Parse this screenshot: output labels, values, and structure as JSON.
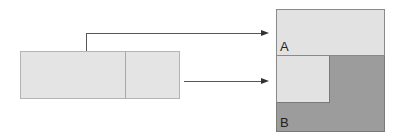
{
  "diagram": {
    "source": {
      "segments": 2
    },
    "target": {
      "regions": [
        {
          "label": "A",
          "color": "#e2e2e2"
        },
        {
          "label": "B",
          "color": "#9c9c9c"
        }
      ]
    },
    "arrows": [
      {
        "from": "source-left-segment",
        "to": "region-A"
      },
      {
        "from": "source",
        "to": "region-B"
      }
    ],
    "colors": {
      "light_fill": "#e4e4e4",
      "dark_fill": "#9c9c9c",
      "line": "#555555"
    }
  }
}
